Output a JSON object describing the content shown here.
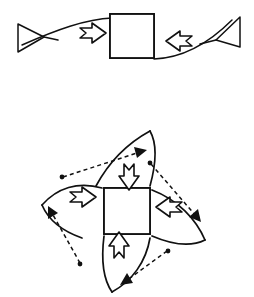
{
  "figure": {
    "background_color": "#ffffff",
    "ink_color": "#111111",
    "width": 254,
    "height": 297,
    "panels": [
      {
        "id": "panel-uniaxial",
        "label": "uniaxial compression panel",
        "description": "Two opposing open triangular arrowheads connected by a shallow S-curve, with two hollow block arrows pressing inward on a central hatched square",
        "sample": {
          "name": "hatched-square-sample",
          "shape": "square",
          "fill_pattern": "dense curved hatching",
          "x": 110,
          "y": 14,
          "size": 44
        },
        "open_arrowheads": [
          {
            "name": "left-open-arrowhead",
            "direction": "right",
            "x": 14,
            "y": 38
          },
          {
            "name": "right-open-arrowhead",
            "direction": "left",
            "x": 236,
            "y": 30
          }
        ],
        "block_arrows": [
          {
            "name": "left-block-arrow",
            "direction": "right",
            "x": 86,
            "y": 32
          },
          {
            "name": "right-block-arrow",
            "direction": "left",
            "x": 172,
            "y": 42
          }
        ],
        "baseline": {
          "name": "s-curve-baseline",
          "style": "solid",
          "description": "shallow S shaped guide curve passing behind the square"
        }
      },
      {
        "id": "panel-rotational",
        "label": "four-fold rotational shear panel",
        "description": "Pinwheel arrangement: central hatched square surrounded by four hollow block arrows pointing inward, four dashed double-ended vectors forming a tilted square with node dots at the corners, and four curved spiral arms",
        "sample": {
          "name": "hatched-square-sample",
          "shape": "square",
          "fill_pattern": "dense curved hatching",
          "x": 104,
          "y": 188,
          "size": 46
        },
        "block_arrows": [
          {
            "name": "top-block-arrow",
            "direction": "down",
            "x": 130,
            "y": 166
          },
          {
            "name": "right-block-arrow",
            "direction": "left",
            "x": 166,
            "y": 206
          },
          {
            "name": "bottom-block-arrow",
            "direction": "up",
            "x": 120,
            "y": 244
          },
          {
            "name": "left-block-arrow",
            "direction": "right",
            "x": 84,
            "y": 196
          }
        ],
        "dashed_vectors": [
          {
            "name": "dashed-vector-upper-left",
            "from": "node-left",
            "to": "arrowhead-top",
            "style": "dashed",
            "head": "solid-filled"
          },
          {
            "name": "dashed-vector-upper-right",
            "from": "node-top",
            "to": "arrowhead-right",
            "style": "dashed",
            "head": "solid-filled"
          },
          {
            "name": "dashed-vector-lower-right",
            "from": "node-right",
            "to": "arrowhead-bottom",
            "style": "dashed",
            "head": "solid-filled"
          },
          {
            "name": "dashed-vector-lower-left",
            "from": "node-bottom",
            "to": "arrowhead-left",
            "style": "dashed",
            "head": "solid-filled"
          }
        ],
        "node_dots": [
          {
            "name": "node-left",
            "x": 62,
            "y": 177
          },
          {
            "name": "node-top",
            "x": 150,
            "y": 163
          },
          {
            "name": "node-right",
            "x": 168,
            "y": 251
          },
          {
            "name": "node-bottom",
            "x": 80,
            "y": 264
          }
        ],
        "curved_arms": [
          {
            "name": "curved-arm-top",
            "sweep": "counter-clockwise"
          },
          {
            "name": "curved-arm-right",
            "sweep": "counter-clockwise"
          },
          {
            "name": "curved-arm-bottom",
            "sweep": "counter-clockwise"
          },
          {
            "name": "curved-arm-left",
            "sweep": "counter-clockwise"
          }
        ]
      }
    ]
  }
}
